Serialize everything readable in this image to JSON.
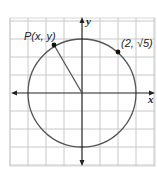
{
  "diagram": {
    "type": "unit-circle-graph",
    "grid": {
      "x_min": -4,
      "x_max": 4,
      "y_min": -4,
      "y_max": 4,
      "cell_px": 18
    },
    "circle": {
      "center": [
        0,
        0
      ],
      "radius": 3,
      "color": "#555555"
    },
    "axes": {
      "x_label": "x",
      "y_label": "y"
    },
    "points": [
      {
        "label": "P(x, y)",
        "x": -1.5,
        "y": 2.6
      },
      {
        "label": "(2, √5)",
        "x": 2,
        "y": 2.236
      }
    ],
    "colors": {
      "grid": "#c8c8c8",
      "axis": "#222222",
      "point": "#111111",
      "background": "#ffffff"
    }
  }
}
